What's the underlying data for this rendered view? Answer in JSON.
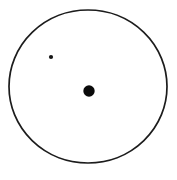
{
  "canvas": {
    "width": 177,
    "height": 180,
    "background_color": "#ffffff"
  },
  "diagram": {
    "outer_circle": {
      "cx": 88,
      "cy": 86.5,
      "rx": 79,
      "ry": 76.5,
      "fill": "#ffffff",
      "stroke": "#1c1c1c",
      "stroke_width": 1.7
    },
    "small_dot": {
      "cx": 51,
      "cy": 57,
      "r": 2.1,
      "fill": "#151515"
    },
    "large_dot": {
      "cx": 89,
      "cy": 91,
      "r": 5.7,
      "fill": "#0a0a0a"
    }
  }
}
